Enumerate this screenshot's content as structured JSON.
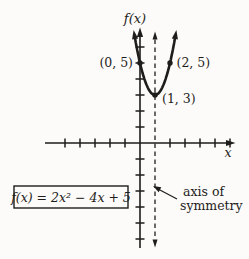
{
  "figure": {
    "background": "#fcfbf9",
    "ink_color": "#1f1d1b"
  },
  "chart_data": {
    "type": "line",
    "subtype": "function-plot",
    "title": "",
    "xlabel": "x",
    "ylabel": "f(x)",
    "function": {
      "expression": "f(x) = 2x² − 4x + 5",
      "a": 2,
      "b": -4,
      "c": 5,
      "domain": [
        -0.323,
        2.323
      ]
    },
    "points": [
      {
        "x": 0,
        "y": 5,
        "label": "(0, 5)"
      },
      {
        "x": 2,
        "y": 5,
        "label": "(2, 5)"
      },
      {
        "x": 1,
        "y": 3,
        "label": "(1, 3)"
      }
    ],
    "axis_of_symmetry": {
      "x": 1,
      "style": "dashed",
      "label_lines": [
        "axis of",
        "symmetry"
      ]
    },
    "equation_box": {
      "label": "f(x) = 2x² − 4x + 5"
    },
    "x_ticks": [
      -5,
      -4,
      -3,
      -2,
      -1,
      2,
      3,
      4,
      5,
      6
    ],
    "y_ticks": [
      6,
      5,
      4,
      3,
      2,
      1,
      -1,
      -2,
      -3,
      -4,
      -5,
      -6
    ],
    "xlim": [
      -6.3,
      6.5
    ],
    "ylim": [
      -6.6,
      7.2
    ],
    "grid": false,
    "legend": false
  }
}
